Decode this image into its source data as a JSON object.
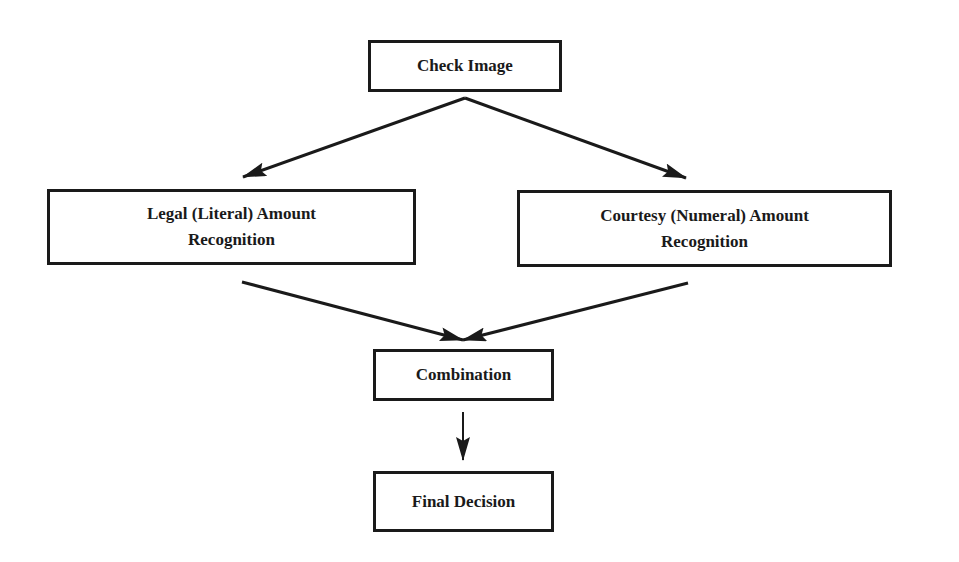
{
  "diagram": {
    "type": "flowchart",
    "colors": {
      "stroke": "#1a1a1a",
      "text": "#1a1a1a",
      "background": "#ffffff"
    },
    "nodes": [
      {
        "id": "check_image",
        "lines": [
          "Check Image"
        ]
      },
      {
        "id": "legal",
        "lines": [
          "Legal (Literal) Amount",
          "Recognition"
        ]
      },
      {
        "id": "courtesy",
        "lines": [
          "Courtesy (Numeral) Amount",
          "Recognition"
        ]
      },
      {
        "id": "combination",
        "lines": [
          "Combination"
        ]
      },
      {
        "id": "final_decision",
        "lines": [
          "Final Decision"
        ]
      }
    ],
    "edges": [
      {
        "from": "check_image",
        "to": "legal"
      },
      {
        "from": "check_image",
        "to": "courtesy"
      },
      {
        "from": "legal",
        "to": "combination"
      },
      {
        "from": "courtesy",
        "to": "combination"
      },
      {
        "from": "combination",
        "to": "final_decision"
      }
    ]
  }
}
